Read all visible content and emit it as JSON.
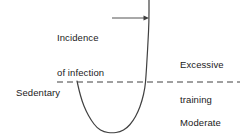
{
  "figure": {
    "width": 240,
    "height": 137,
    "background_color": "#ffffff",
    "line_color": "#404040",
    "text_color": "#1a1a1a"
  },
  "labels": {
    "sedentary": "Sedentary",
    "incidence_line1": "Incidence",
    "incidence_line2": "of infection",
    "excessive_line1": "Excessive",
    "excessive_line2": "training",
    "moderate_line1": "Moderate",
    "moderate_line2": "regular",
    "moderate_line3": "exercise"
  },
  "chart_data": {
    "type": "line",
    "title": "",
    "xlabel": "",
    "ylabel": "Incidence of infection",
    "grid": false,
    "legend": null,
    "annotations": [
      {
        "name": "incidence-of-infection",
        "text": "Incidence of infection",
        "points_to_x": 149,
        "points_to_y": 18
      },
      {
        "name": "excessive-training",
        "text": "Excessive training",
        "region": "above-baseline-right"
      },
      {
        "name": "moderate-regular-exercise",
        "text": "Moderate regular exercise",
        "region": "below-baseline-right"
      },
      {
        "name": "sedentary-baseline",
        "text": "Sedentary",
        "baseline_y": 82
      }
    ],
    "reference_line": {
      "name": "sedentary-level",
      "orientation": "horizontal",
      "y": 82,
      "x_start": 57,
      "x_end": 240,
      "style": "dashed",
      "label": "Sedentary"
    },
    "series": [
      {
        "name": "incidence-of-infection-curve",
        "style": "solid",
        "points": [
          [
            77,
            81
          ],
          [
            79,
            90
          ],
          [
            82,
            101
          ],
          [
            86,
            111
          ],
          [
            91,
            120
          ],
          [
            97,
            128
          ],
          [
            104,
            132
          ],
          [
            112,
            133
          ],
          [
            120,
            132
          ],
          [
            127,
            128
          ],
          [
            133,
            121
          ],
          [
            138,
            112
          ],
          [
            142,
            101
          ],
          [
            145,
            88
          ],
          [
            146,
            76
          ],
          [
            147,
            60
          ],
          [
            148,
            42
          ],
          [
            149,
            22
          ],
          [
            149,
            0
          ]
        ]
      }
    ]
  }
}
